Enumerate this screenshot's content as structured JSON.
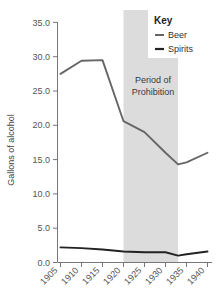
{
  "chart_data": {
    "type": "line",
    "title": "",
    "xlabel": "",
    "ylabel": "Gallons of alcohol",
    "xlim": [
      1905,
      1940
    ],
    "ylim": [
      0.0,
      35.0
    ],
    "grid": false,
    "x": [
      1905,
      1910,
      1915,
      1920,
      1925,
      1930,
      1933,
      1935,
      1940
    ],
    "xticks": [
      "1905",
      "1910",
      "1915",
      "1920",
      "1925",
      "1930",
      "1935",
      "1940"
    ],
    "yticks": [
      "0.0",
      "5.0",
      "10.0",
      "15.0",
      "20.0",
      "25.0",
      "30.0",
      "35.0"
    ],
    "series": [
      {
        "name": "Beer",
        "color": "#666666",
        "values": [
          27.5,
          29.4,
          29.5,
          20.6,
          19.0,
          16.0,
          14.3,
          14.6,
          16.0
        ]
      },
      {
        "name": "Spirits",
        "color": "#222222",
        "values": [
          2.2,
          2.1,
          1.9,
          1.6,
          1.5,
          1.5,
          1.0,
          1.2,
          1.6
        ]
      }
    ],
    "legend": {
      "title": "Key",
      "position": "top-right",
      "entries": [
        "Beer",
        "Spirits"
      ]
    },
    "annotations": [
      {
        "text_line1": "Period of",
        "text_line2": "Prohibition",
        "span_start": 1920,
        "span_end": 1933,
        "shading_color": "#dcdcdc"
      }
    ]
  }
}
